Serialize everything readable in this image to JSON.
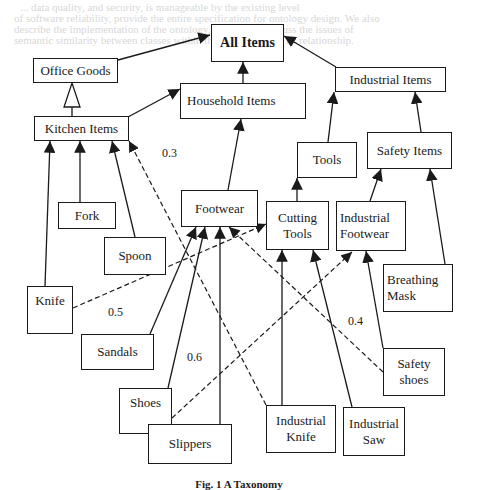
{
  "background_text": [
    "... data quality, and security, is manageable by the existing level",
    "of software reliability, provide the entire specification for ontology design. We also",
    "describe the implementation of the ontology, the authors discuss the issues of",
    "semantic similarity between classes within the taxonomy and its relationship."
  ],
  "nodes": {
    "all_items": "All Items",
    "office_goods": "Office Goods",
    "household_items": "Household Items",
    "industrial_items": "Industrial Items",
    "kitchen_items": "Kitchen Items",
    "tools": "Tools",
    "safety_items": "Safety Items",
    "fork": "Fork",
    "footwear": "Footwear",
    "cutting_tools_1": "Cutting",
    "cutting_tools_2": "Tools",
    "industrial_footwear_1": "Industrial",
    "industrial_footwear_2": "Footwear",
    "spoon": "Spoon",
    "breathing_mask_1": "Breathing",
    "breathing_mask_2": "Mask",
    "knife": "Knife",
    "sandals": "Sandals",
    "safety_shoes_1": "Safety",
    "safety_shoes_2": "shoes",
    "shoes": "Shoes",
    "slippers": "Slippers",
    "industrial_knife_1": "Industrial",
    "industrial_knife_2": "Knife",
    "industrial_saw_1": "Industrial",
    "industrial_saw_2": "Saw"
  },
  "edge_weights": {
    "kitchen_to_industrial_knife": "0.3",
    "knife_to_cutting_tools": "0.5",
    "shoes_to_industrial_footwear": "0.6",
    "safety_shoes_to_footwear": "0.4"
  },
  "edges": [
    {
      "from": "Office Goods",
      "to": "All Items",
      "style": "solid"
    },
    {
      "from": "Household Items",
      "to": "All Items",
      "style": "solid"
    },
    {
      "from": "Industrial Items",
      "to": "All Items",
      "style": "solid"
    },
    {
      "from": "Kitchen Items",
      "to": "Office Goods",
      "style": "generalization"
    },
    {
      "from": "Kitchen Items",
      "to": "Household Items",
      "style": "solid"
    },
    {
      "from": "Footwear",
      "to": "Household Items",
      "style": "solid"
    },
    {
      "from": "Tools",
      "to": "Industrial Items",
      "style": "solid"
    },
    {
      "from": "Safety Items",
      "to": "Industrial Items",
      "style": "solid"
    },
    {
      "from": "Cutting Tools",
      "to": "Tools",
      "style": "solid"
    },
    {
      "from": "Industrial Footwear",
      "to": "Safety Items",
      "style": "solid"
    },
    {
      "from": "Breathing Mask",
      "to": "Safety Items",
      "style": "solid"
    },
    {
      "from": "Knife",
      "to": "Kitchen Items",
      "style": "solid"
    },
    {
      "from": "Fork",
      "to": "Kitchen Items",
      "style": "solid"
    },
    {
      "from": "Spoon",
      "to": "Kitchen Items",
      "style": "solid"
    },
    {
      "from": "Sandals",
      "to": "Footwear",
      "style": "solid"
    },
    {
      "from": "Shoes",
      "to": "Footwear",
      "style": "solid"
    },
    {
      "from": "Slippers",
      "to": "Footwear",
      "style": "solid"
    },
    {
      "from": "Industrial Knife",
      "to": "Cutting Tools",
      "style": "solid"
    },
    {
      "from": "Industrial Saw",
      "to": "Cutting Tools",
      "style": "solid"
    },
    {
      "from": "Safety shoes",
      "to": "Industrial Footwear",
      "style": "solid"
    },
    {
      "from": "Industrial Knife",
      "to": "Kitchen Items",
      "style": "dashed",
      "weight": "0.3"
    },
    {
      "from": "Knife",
      "to": "Cutting Tools",
      "style": "dashed",
      "weight": "0.5"
    },
    {
      "from": "Shoes",
      "to": "Industrial Footwear",
      "style": "dashed",
      "weight": "0.6"
    },
    {
      "from": "Safety shoes",
      "to": "Footwear",
      "style": "dashed",
      "weight": "0.4"
    }
  ],
  "caption": "Fig. 1 A Taxonomy"
}
